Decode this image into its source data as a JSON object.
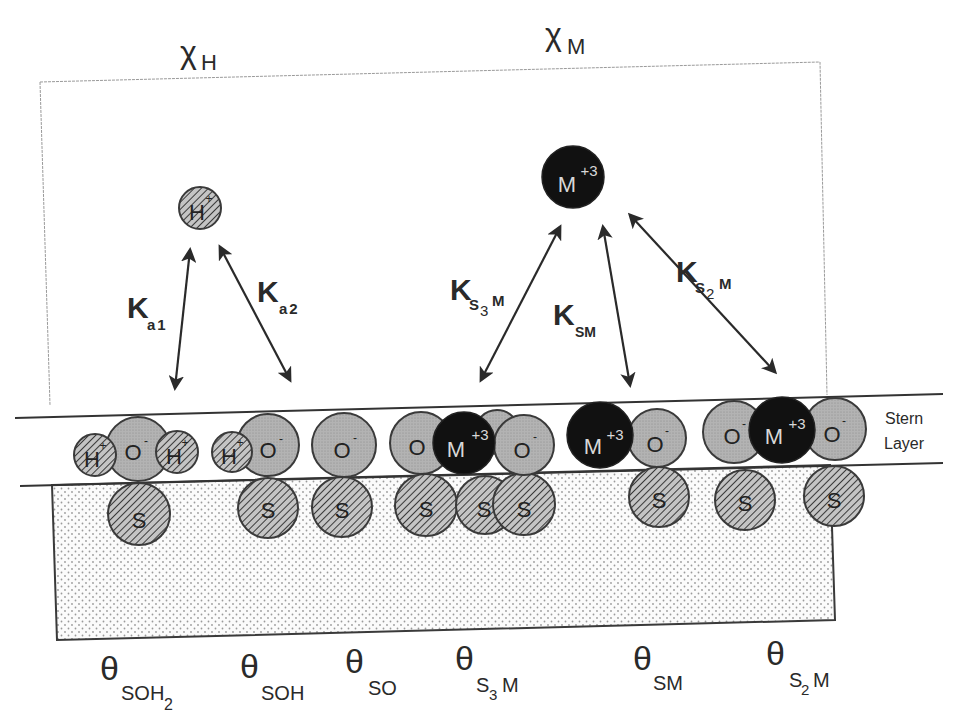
{
  "figure": {
    "type": "surface-complexation-diagram",
    "bulk_labels": {
      "chi_h": {
        "symbol": "χ",
        "sub": "H"
      },
      "chi_m": {
        "symbol": "χ",
        "sub": "M"
      }
    },
    "free_ions": {
      "proton": {
        "label": "H",
        "charge": "+"
      },
      "metal": {
        "label": "M",
        "charge": "+3"
      }
    },
    "constants": {
      "ka1": {
        "main": "K",
        "sub": "a1"
      },
      "ka2": {
        "main": "K",
        "sub": "a2"
      },
      "ks3m": {
        "main": "K",
        "sub_s": "S",
        "sub_n": "3",
        "sub_m": "M"
      },
      "ksm": {
        "main": "K",
        "sub": "SM"
      },
      "ks2m": {
        "main": "K",
        "sub_s": "S",
        "sub_n": "2",
        "sub_m": "M"
      }
    },
    "stern_layer": {
      "line1": "Stern",
      "line2": "Layer"
    },
    "atom_labels": {
      "H": "H",
      "O": "O",
      "S": "S",
      "M": "M",
      "minus": "-",
      "plus": "+",
      "plus3": "+3"
    },
    "surface_species": [
      {
        "theta": "θ",
        "sub": "SOH",
        "sub2": "2"
      },
      {
        "theta": "θ",
        "sub": "SOH",
        "sub2": ""
      },
      {
        "theta": "θ",
        "sub": "SO",
        "sub2": ""
      },
      {
        "theta": "θ",
        "sub_s": "S",
        "sub_n": "3",
        "sub_m": "M"
      },
      {
        "theta": "θ",
        "sub": "SM",
        "sub2": ""
      },
      {
        "theta": "θ",
        "sub_s": "S",
        "sub_n": "2",
        "sub_m": "M"
      }
    ],
    "colors": {
      "outline": "#3a3a3a",
      "oxygen_fill": "#a9a9a9",
      "metal_fill": "#111111",
      "hatch": "#3a3a3a",
      "solid_dots": "#9a9a9a"
    }
  }
}
